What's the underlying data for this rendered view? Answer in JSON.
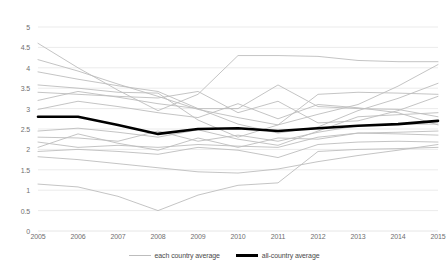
{
  "chart_data": {
    "type": "line",
    "title": "",
    "subtitle": "",
    "xlabel": "",
    "ylabel": "",
    "x": [
      2005,
      2006,
      2007,
      2008,
      2009,
      2010,
      2011,
      2012,
      2013,
      2014,
      2015
    ],
    "xtick_labels": [
      "2005",
      "2006",
      "2007",
      "2008",
      "2009",
      "2010",
      "2011",
      "2012",
      "2013",
      "2014",
      "2015"
    ],
    "ytick_labels": [
      "0",
      "0.5",
      "1",
      "1.5",
      "2",
      "2.5",
      "3",
      "3.5",
      "4",
      "4.5",
      "5"
    ],
    "ytick_values": [
      0,
      0.5,
      1,
      1.5,
      2,
      2.5,
      3,
      3.5,
      4,
      4.5,
      5
    ],
    "ylim": [
      0,
      5
    ],
    "xlim": [
      2005,
      2015
    ],
    "grid": "horizontal",
    "legend_position": "bottom-center",
    "colors": {
      "each_country": "#bdbdbd",
      "all_country": "#000000",
      "gridline": "#e6e6e6",
      "axis_text": "#6f6f6f",
      "legend_text": "#4a4a4a",
      "background": "#ffffff"
    },
    "legend": [
      {
        "name": "each country average",
        "color": "#bdbdbd",
        "width": 1
      },
      {
        "name": "all-country average",
        "color": "#000000",
        "width": 3
      }
    ],
    "series": [
      {
        "name": "each country average",
        "color": "#bdbdbd",
        "emphasis": false,
        "values": [
          4.6,
          4.0,
          3.45,
          2.95,
          3.35,
          4.3,
          4.3,
          4.28,
          4.18,
          4.15,
          4.15
        ]
      },
      {
        "name": "each country average",
        "color": "#bdbdbd",
        "emphasis": false,
        "values": [
          4.2,
          3.92,
          3.6,
          3.3,
          2.98,
          2.78,
          2.6,
          2.86,
          3.1,
          3.55,
          4.08
        ]
      },
      {
        "name": "each country average",
        "color": "#bdbdbd",
        "emphasis": false,
        "values": [
          3.9,
          3.72,
          3.56,
          3.42,
          3.0,
          2.62,
          2.4,
          2.55,
          2.95,
          3.25,
          3.62
        ]
      },
      {
        "name": "each country average",
        "color": "#bdbdbd",
        "emphasis": false,
        "values": [
          3.58,
          3.5,
          3.4,
          3.38,
          2.72,
          2.3,
          2.6,
          3.35,
          3.4,
          3.38,
          3.35
        ]
      },
      {
        "name": "each country average",
        "color": "#bdbdbd",
        "emphasis": false,
        "values": [
          3.4,
          3.35,
          3.3,
          3.26,
          3.42,
          2.9,
          3.18,
          2.65,
          2.7,
          2.95,
          3.3
        ]
      },
      {
        "name": "each country average",
        "color": "#bdbdbd",
        "emphasis": false,
        "values": [
          3.2,
          3.42,
          3.28,
          3.12,
          3.0,
          3.0,
          3.58,
          3.05,
          3.0,
          2.98,
          2.8
        ]
      },
      {
        "name": "each country average",
        "color": "#bdbdbd",
        "emphasis": false,
        "values": [
          2.98,
          3.18,
          3.05,
          2.9,
          2.78,
          3.12,
          2.75,
          3.1,
          3.02,
          2.9,
          2.6
        ]
      },
      {
        "name": "each country average",
        "color": "#bdbdbd",
        "emphasis": false,
        "values": [
          2.45,
          2.52,
          2.42,
          2.3,
          2.48,
          2.25,
          2.1,
          2.45,
          2.8,
          2.85,
          2.9
        ]
      },
      {
        "name": "each country average",
        "color": "#bdbdbd",
        "emphasis": false,
        "values": [
          2.3,
          2.28,
          2.2,
          2.45,
          2.2,
          2.35,
          2.2,
          2.42,
          2.58,
          2.62,
          2.62
        ]
      },
      {
        "name": "each country average",
        "color": "#bdbdbd",
        "emphasis": false,
        "values": [
          2.18,
          2.05,
          2.1,
          2.05,
          2.12,
          2.08,
          2.05,
          2.3,
          2.4,
          2.42,
          2.45
        ]
      },
      {
        "name": "each country average",
        "color": "#bdbdbd",
        "emphasis": false,
        "values": [
          2.05,
          2.38,
          2.15,
          1.98,
          2.28,
          2.05,
          2.28,
          2.25,
          2.4,
          2.38,
          2.35
        ]
      },
      {
        "name": "each country average",
        "color": "#bdbdbd",
        "emphasis": false,
        "values": [
          1.95,
          2.0,
          1.95,
          1.88,
          2.05,
          1.98,
          1.8,
          2.12,
          2.18,
          2.2,
          2.18
        ]
      },
      {
        "name": "each country average",
        "color": "#bdbdbd",
        "emphasis": false,
        "values": [
          1.82,
          1.75,
          1.65,
          1.55,
          1.45,
          1.42,
          1.52,
          1.7,
          1.85,
          1.98,
          2.12
        ]
      },
      {
        "name": "each country average",
        "color": "#bdbdbd",
        "emphasis": false,
        "values": [
          1.15,
          1.08,
          0.85,
          0.5,
          0.88,
          1.12,
          1.18,
          1.95,
          2.0,
          2.02,
          2.05
        ]
      },
      {
        "name": "all-country average",
        "color": "#000000",
        "emphasis": true,
        "values": [
          2.8,
          2.8,
          2.6,
          2.38,
          2.5,
          2.52,
          2.45,
          2.52,
          2.58,
          2.62,
          2.7
        ]
      }
    ]
  }
}
